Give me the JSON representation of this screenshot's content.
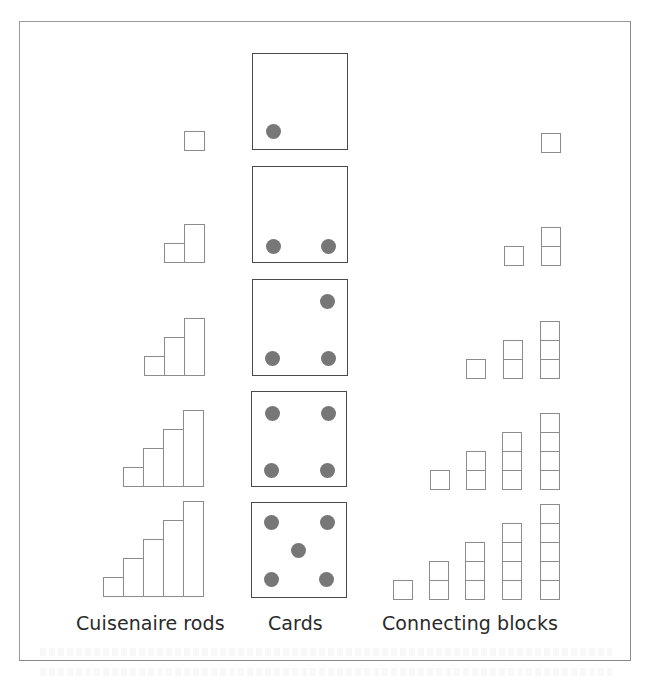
{
  "figure": {
    "labels": {
      "rods": "Cuisenaire rods",
      "cards": "Cards",
      "blocks": "Connecting blocks"
    },
    "colors": {
      "frame": "#8a8a8a",
      "outline": "#8c8c8c",
      "card_border": "#4a4a4a",
      "dot": "#777777",
      "text": "#2a2a2a"
    },
    "rows": [
      {
        "number": 1,
        "card": {
          "x": 252,
          "y": 53,
          "w": 96,
          "h": 97,
          "dots": [
            [
              272,
              130
            ]
          ]
        },
        "rods": {
          "bottom": 151,
          "unit": 19,
          "width": 20,
          "x0": 184
        },
        "blocks": {
          "bottom": 152,
          "size": 19,
          "columns_x": [
            541
          ]
        }
      },
      {
        "number": 2,
        "card": {
          "x": 252,
          "y": 166,
          "w": 96,
          "h": 97,
          "dots": [
            [
              272,
              245
            ],
            [
              327,
              245
            ]
          ]
        },
        "rods": {
          "bottom": 263,
          "unit": 19,
          "width": 20,
          "x0": 164
        },
        "blocks": {
          "bottom": 265,
          "size": 19,
          "columns_x": [
            504,
            541
          ]
        }
      },
      {
        "number": 3,
        "card": {
          "x": 252,
          "y": 279,
          "w": 96,
          "h": 97,
          "dots": [
            [
              326,
              300
            ],
            [
              271,
              357
            ],
            [
              327,
              357
            ]
          ]
        },
        "rods": {
          "bottom": 376,
          "unit": 19,
          "width": 20,
          "x0": 144
        },
        "blocks": {
          "bottom": 378,
          "size": 19,
          "columns_x": [
            466,
            503,
            540
          ]
        }
      },
      {
        "number": 4,
        "card": {
          "x": 251,
          "y": 391,
          "w": 96,
          "h": 96,
          "dots": [
            [
              271,
              412
            ],
            [
              327,
              412
            ],
            [
              270,
              469
            ],
            [
              326,
              469
            ]
          ]
        },
        "rods": {
          "bottom": 487,
          "unit": 19,
          "width": 20,
          "x0": 123
        },
        "blocks": {
          "bottom": 489,
          "size": 19,
          "columns_x": [
            430,
            466,
            502,
            540
          ]
        }
      },
      {
        "number": 5,
        "card": {
          "x": 251,
          "y": 502,
          "w": 96,
          "h": 96,
          "dots": [
            [
              270,
              521
            ],
            [
              326,
              521
            ],
            [
              297,
              549
            ],
            [
              270,
              578
            ],
            [
              325,
              578
            ]
          ]
        },
        "rods": {
          "bottom": 597,
          "unit": 19,
          "width": 20,
          "x0": 103
        },
        "blocks": {
          "bottom": 599,
          "size": 19,
          "columns_x": [
            393,
            429,
            465,
            502,
            540
          ]
        }
      }
    ]
  }
}
